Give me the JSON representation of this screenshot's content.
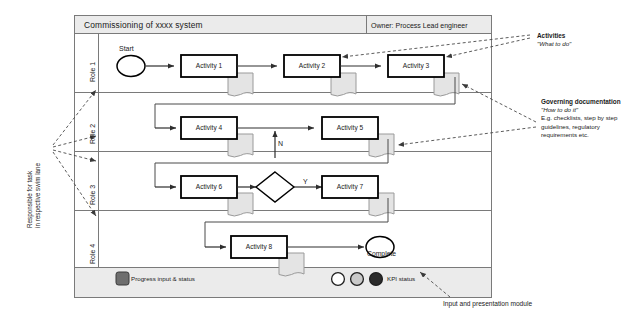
{
  "diagram": {
    "type": "swimlane-flowchart",
    "header": {
      "title": "Commissioning of xxxx  system",
      "owner": "Owner:  Process Lead engineer"
    },
    "lanes": [
      {
        "id": "role-1",
        "label": "Role 1"
      },
      {
        "id": "role-2",
        "label": "Role 2"
      },
      {
        "id": "role-3",
        "label": "Role 3"
      },
      {
        "id": "role-4",
        "label": "Role 4"
      }
    ],
    "nodes": {
      "start": "Start",
      "activity_1": "Activity 1",
      "activity_2": "Activity 2",
      "activity_3": "Activity 3",
      "activity_4": "Activity 4",
      "activity_5": "Activity 5",
      "activity_6": "Activity 6",
      "activity_7": "Activity 7",
      "activity_8": "Activity 8",
      "complete": "Complete"
    },
    "branch_labels": {
      "no": "N",
      "yes": "Y"
    },
    "annotations": {
      "activities_title": "Activities",
      "activities_sub": "\"What to do\"",
      "governing_title": "Governing documentation",
      "governing_sub": "\"How to do it\"",
      "governing_body_1": "E.g. checklists, step by step",
      "governing_body_2": "guidelines, regulatory",
      "governing_body_3": "requirements etc.",
      "responsible_line_1": "Responsible for task",
      "responsible_line_2": "in respective swim lane",
      "input_module": "Input and presentation module"
    },
    "legend": {
      "progress_label": "Progress input & status",
      "kpi_label": "KPI status",
      "kpi_colors": [
        "#ffffff",
        "#c9c9c9",
        "#2b2b2b"
      ],
      "progress_color": "#6e6e6e"
    },
    "colors": {
      "frame_stroke": "#7a7a7a",
      "header_fill": "#ebebeb",
      "footer_fill": "#ebebeb",
      "node_stroke": "#000000",
      "node_fill": "#ffffff",
      "doc_fill": "#e4e4e4",
      "doc_stroke": "#9a9a9a",
      "flow_stroke": "#3d3d3d",
      "dashed_stroke": "#555555"
    }
  }
}
